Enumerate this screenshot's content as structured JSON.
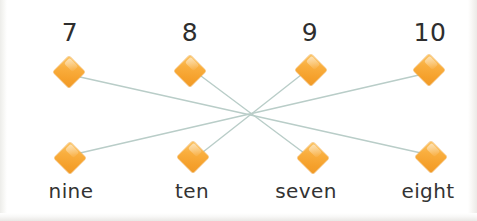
{
  "exercise": {
    "type": "matching-lines",
    "title": "Match the numeral to the number word",
    "colors": {
      "node_fill": "#f7a82e",
      "node_highlight": "#fbc66a",
      "link_stroke": "#b9cdc8",
      "background": "#ffffff",
      "text": "#333333"
    },
    "top_row": [
      {
        "id": "top-7",
        "label": "7",
        "x": 69,
        "label_x": 70,
        "label_y": 20,
        "node_x": 69,
        "node_y": 72
      },
      {
        "id": "top-8",
        "label": "8",
        "x": 190,
        "label_x": 190,
        "label_y": 20,
        "node_x": 190,
        "node_y": 71
      },
      {
        "id": "top-9",
        "label": "9",
        "x": 311,
        "label_x": 310,
        "label_y": 20,
        "node_x": 311,
        "node_y": 70
      },
      {
        "id": "top-10",
        "label": "10",
        "x": 429,
        "label_x": 430,
        "label_y": 20,
        "node_x": 429,
        "node_y": 70
      }
    ],
    "bottom_row": [
      {
        "id": "bot-nine",
        "label": "nine",
        "label_x": 71,
        "label_y": 181,
        "node_x": 70,
        "node_y": 158
      },
      {
        "id": "bot-ten",
        "label": "ten",
        "label_x": 192,
        "label_y": 181,
        "node_x": 193,
        "node_y": 157
      },
      {
        "id": "bot-seven",
        "label": "seven",
        "label_x": 306,
        "label_y": 181,
        "node_x": 313,
        "node_y": 158
      },
      {
        "id": "bot-eight",
        "label": "eight",
        "label_x": 428,
        "label_y": 181,
        "node_x": 431,
        "node_y": 157
      }
    ],
    "links": [
      {
        "id": "link-7-eight",
        "from": "top-7",
        "to": "bot-eight",
        "x1": 80,
        "y1": 77,
        "x2": 421,
        "y2": 153
      },
      {
        "id": "link-8-seven",
        "from": "top-8",
        "to": "bot-seven",
        "x1": 201,
        "y1": 76,
        "x2": 304,
        "y2": 153
      },
      {
        "id": "link-9-ten",
        "from": "top-9",
        "to": "bot-ten",
        "x1": 301,
        "y1": 75,
        "x2": 203,
        "y2": 152
      },
      {
        "id": "link-10-nine",
        "from": "top-10",
        "to": "bot-nine",
        "x1": 419,
        "y1": 75,
        "x2": 80,
        "y2": 153
      }
    ]
  }
}
